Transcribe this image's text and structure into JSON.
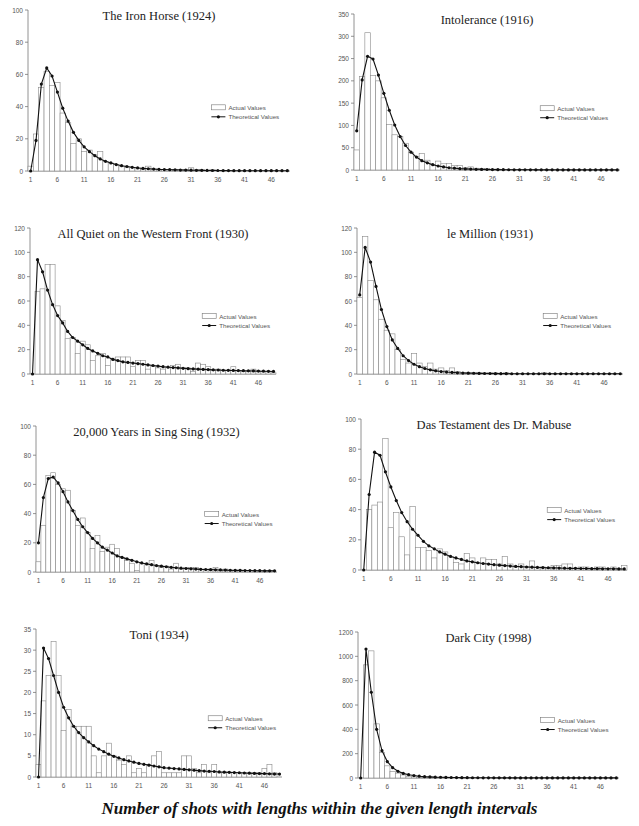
{
  "caption": "Number of shots with lengths within the given length intervals",
  "legend": {
    "actual": "Actual Values",
    "theoretical": "Theoretical Values"
  },
  "chart_data": [
    {
      "type": "bar",
      "title": "The Iron Horse (1924)",
      "xlabel": "",
      "ylabel": "",
      "ylim": [
        0,
        100
      ],
      "yticks": [
        0,
        20,
        40,
        60,
        80,
        100
      ],
      "xticks": [
        1,
        6,
        11,
        16,
        21,
        26,
        31,
        36,
        41,
        46
      ],
      "grid": false,
      "legend_position": "right-middle",
      "series": [
        {
          "name": "Actual Values",
          "kind": "bar",
          "values": [
            3,
            23,
            52,
            62,
            53,
            55,
            36,
            30,
            17,
            20,
            12,
            13,
            10,
            12,
            6,
            5,
            4,
            3,
            2,
            2,
            2,
            1,
            3,
            1,
            1,
            1,
            1,
            1,
            1,
            1,
            2,
            1,
            1,
            0,
            1,
            0,
            0,
            0,
            0,
            0,
            0,
            0,
            0,
            0,
            0,
            0,
            0,
            0,
            0
          ]
        },
        {
          "name": "Theoretical Values",
          "kind": "line",
          "values": [
            0,
            19,
            54,
            64,
            59,
            49,
            39,
            31,
            24,
            19,
            15,
            12,
            9.5,
            7.5,
            6,
            5,
            4,
            3.3,
            2.8,
            2.3,
            1.9,
            1.6,
            1.4,
            1.2,
            1,
            0.9,
            0.8,
            0.7,
            0.6,
            0.55,
            0.5,
            0.45,
            0.4,
            0.35,
            0.3,
            0.3,
            0.25,
            0.25,
            0.2,
            0.2,
            0.2,
            0.2,
            0.2,
            0.2,
            0.2,
            0.2,
            0.2,
            0.2,
            0.2
          ]
        }
      ]
    },
    {
      "type": "bar",
      "title": "Intolerance (1916)",
      "xlabel": "",
      "ylabel": "",
      "ylim": [
        0,
        350
      ],
      "yticks": [
        0,
        50,
        100,
        150,
        200,
        250,
        300,
        350
      ],
      "xticks": [
        1,
        6,
        11,
        16,
        21,
        26,
        31,
        36,
        41,
        46
      ],
      "grid": false,
      "legend_position": "right-middle",
      "series": [
        {
          "name": "Actual Values",
          "kind": "bar",
          "values": [
            45,
            210,
            308,
            212,
            200,
            162,
            102,
            79,
            75,
            60,
            40,
            30,
            37,
            22,
            12,
            20,
            14,
            15,
            10,
            10,
            5,
            7,
            4,
            3,
            3,
            2,
            2,
            1,
            1,
            1,
            1,
            1,
            1,
            1,
            0,
            1,
            0,
            0,
            0,
            0,
            0,
            0,
            0,
            0,
            0,
            0,
            0,
            0,
            0
          ]
        },
        {
          "name": "Theoretical Values",
          "kind": "line",
          "values": [
            88,
            202,
            255,
            249,
            213,
            172,
            134,
            101,
            75,
            55,
            40,
            29,
            21,
            16,
            12,
            9,
            7,
            5,
            4,
            3,
            2.5,
            2,
            1.6,
            1.3,
            1.1,
            0.9,
            0.8,
            0.7,
            0.6,
            0.5,
            0.5,
            0.4,
            0.4,
            0.3,
            0.3,
            0.3,
            0.3,
            0.2,
            0.2,
            0.2,
            0.2,
            0.2,
            0.2,
            0.2,
            0.2,
            0.2,
            0.2,
            0.2,
            0.2
          ]
        }
      ]
    },
    {
      "type": "bar",
      "title": "All Quiet on the Western Front (1930)",
      "xlabel": "",
      "ylabel": "",
      "ylim": [
        0,
        120
      ],
      "yticks": [
        0,
        20,
        40,
        60,
        80,
        100,
        120
      ],
      "xticks": [
        1,
        6,
        11,
        16,
        21,
        26,
        31,
        36,
        41,
        46
      ],
      "grid": false,
      "legend_position": "right-middle",
      "series": [
        {
          "name": "Actual Values",
          "kind": "bar",
          "values": [
            0,
            68,
            70,
            90,
            90,
            56,
            44,
            29,
            30,
            17,
            27,
            24,
            11,
            15,
            17,
            7,
            13,
            14,
            14,
            14,
            6,
            11,
            11,
            4,
            6,
            5,
            4,
            6,
            7,
            8,
            5,
            5,
            2,
            9,
            8,
            6,
            3,
            4,
            3,
            3,
            6,
            3,
            2,
            2,
            4,
            2,
            2,
            2,
            1
          ]
        },
        {
          "name": "Theoretical Values",
          "kind": "line",
          "values": [
            0,
            94,
            84,
            69,
            57,
            48,
            42,
            35,
            30,
            27,
            24,
            21,
            19,
            17,
            15,
            14,
            12,
            11,
            10,
            9.5,
            9,
            8.5,
            8,
            7.5,
            7,
            6.5,
            6,
            5.6,
            5.3,
            5,
            4.7,
            4.4,
            4.2,
            4,
            3.8,
            3.6,
            3.4,
            3.3,
            3.1,
            3,
            2.9,
            2.8,
            2.7,
            2.6,
            2.5,
            2.4,
            2.3,
            2.2,
            2.1
          ]
        }
      ]
    },
    {
      "type": "bar",
      "title": "le Million (1931)",
      "xlabel": "",
      "ylabel": "",
      "ylim": [
        0,
        120
      ],
      "yticks": [
        0,
        20,
        40,
        60,
        80,
        100,
        120
      ],
      "xticks": [
        1,
        6,
        11,
        16,
        21,
        26,
        31,
        36,
        41,
        46
      ],
      "grid": false,
      "legend_position": "right-middle",
      "series": [
        {
          "name": "Actual Values",
          "kind": "bar",
          "values": [
            63,
            113,
            77,
            61,
            45,
            36,
            33,
            20,
            12,
            9,
            17,
            9,
            6,
            9,
            4,
            5,
            3,
            5,
            2,
            1,
            1,
            1,
            1,
            1,
            1,
            1,
            0,
            1,
            0,
            0,
            0,
            0,
            0,
            0,
            1,
            0,
            0,
            0,
            0,
            0,
            0,
            0,
            0,
            0,
            0,
            0,
            0,
            0,
            0
          ]
        },
        {
          "name": "Theoretical Values",
          "kind": "line",
          "values": [
            65,
            104,
            92,
            72,
            53,
            39,
            28,
            21,
            15,
            11,
            8,
            6,
            4.5,
            3.4,
            2.6,
            2,
            1.6,
            1.3,
            1,
            0.8,
            0.7,
            0.6,
            0.5,
            0.4,
            0.4,
            0.3,
            0.3,
            0.3,
            0.2,
            0.2,
            0.2,
            0.2,
            0.2,
            0.2,
            0.2,
            0.2,
            0.2,
            0.2,
            0.2,
            0.2,
            0.2,
            0.2,
            0.2,
            0.2,
            0.2,
            0.2,
            0.2,
            0.2,
            0.2
          ]
        }
      ]
    },
    {
      "type": "bar",
      "title": "20,000 Years in Sing Sing (1932)",
      "xlabel": "",
      "ylabel": "",
      "ylim": [
        0,
        100
      ],
      "yticks": [
        0,
        20,
        40,
        60,
        80,
        100
      ],
      "xticks": [
        1,
        6,
        11,
        16,
        21,
        26,
        31,
        36,
        41,
        46
      ],
      "grid": false,
      "legend_position": "right-middle",
      "series": [
        {
          "name": "Actual Values",
          "kind": "bar",
          "values": [
            7,
            32,
            66,
            68,
            60,
            57,
            56,
            42,
            32,
            37,
            27,
            16,
            25,
            14,
            17,
            19,
            16,
            10,
            8,
            6,
            1,
            6,
            6,
            8,
            4,
            3,
            4,
            2,
            6,
            2,
            3,
            3,
            3,
            2,
            2,
            2,
            3,
            1,
            2,
            1,
            1,
            1,
            1,
            1,
            1,
            1,
            1,
            1,
            0
          ]
        },
        {
          "name": "Theoretical Values",
          "kind": "line",
          "values": [
            20,
            51,
            64,
            65,
            61,
            55,
            48,
            42,
            36,
            31,
            27,
            23,
            20,
            17,
            15,
            13,
            11,
            10,
            9,
            8,
            7,
            6.2,
            5.5,
            5,
            4.4,
            4,
            3.6,
            3.2,
            2.9,
            2.6,
            2.4,
            2.2,
            2,
            1.8,
            1.7,
            1.6,
            1.5,
            1.4,
            1.3,
            1.2,
            1.1,
            1.1,
            1,
            1,
            0.9,
            0.9,
            0.8,
            0.8,
            0.8
          ]
        }
      ]
    },
    {
      "type": "bar",
      "title": "Das Testament des Dr. Mabuse",
      "xlabel": "",
      "ylabel": "",
      "ylim": [
        0,
        100
      ],
      "yticks": [
        0,
        20,
        40,
        60,
        80,
        100
      ],
      "xticks": [
        1,
        6,
        11,
        16,
        21,
        26,
        31,
        36,
        41,
        46
      ],
      "grid": false,
      "legend_position": "right-middle",
      "series": [
        {
          "name": "Actual Values",
          "kind": "bar",
          "values": [
            0,
            40,
            43,
            45,
            87,
            28,
            38,
            22,
            10,
            42,
            15,
            15,
            13,
            8,
            14,
            12,
            9,
            5,
            4,
            11,
            8,
            5,
            8,
            7,
            7,
            4,
            9,
            4,
            2,
            4,
            2,
            6,
            2,
            2,
            1,
            3,
            3,
            4,
            4,
            1,
            2,
            2,
            1,
            2,
            2,
            1,
            2,
            1,
            3
          ]
        },
        {
          "name": "Theoretical Values",
          "kind": "line",
          "values": [
            0,
            50,
            78,
            76,
            65,
            55,
            46,
            38,
            32,
            27,
            23,
            19,
            16,
            14,
            12,
            10.5,
            9,
            8,
            7,
            6,
            5.4,
            4.8,
            4.3,
            3.9,
            3.5,
            3.2,
            2.9,
            2.6,
            2.4,
            2.2,
            2,
            1.9,
            1.7,
            1.6,
            1.5,
            1.4,
            1.3,
            1.2,
            1.1,
            1.1,
            1,
            1,
            0.9,
            0.9,
            0.8,
            0.8,
            0.8,
            0.7,
            0.7
          ]
        }
      ]
    },
    {
      "type": "bar",
      "title": "Toni (1934)",
      "xlabel": "",
      "ylabel": "",
      "ylim": [
        0,
        35
      ],
      "yticks": [
        0,
        5,
        10,
        15,
        20,
        25,
        30,
        35
      ],
      "xticks": [
        1,
        6,
        11,
        16,
        21,
        26,
        31,
        36,
        41,
        46
      ],
      "grid": false,
      "legend_position": "right-middle",
      "series": [
        {
          "name": "Actual Values",
          "kind": "bar",
          "values": [
            3,
            18,
            24,
            32,
            24,
            11,
            16,
            12,
            12,
            12,
            12,
            5,
            1,
            5,
            8,
            5,
            4,
            3,
            5,
            1,
            2,
            1,
            3,
            5,
            6,
            1,
            1,
            1,
            1,
            5,
            5,
            2,
            1,
            3,
            1,
            3,
            1,
            1,
            1,
            1,
            1,
            1,
            1,
            1,
            1,
            2,
            3,
            1,
            0
          ]
        },
        {
          "name": "Theoretical Values",
          "kind": "line",
          "values": [
            0,
            30.5,
            28,
            24,
            20,
            16.5,
            14,
            12,
            10.5,
            9.3,
            8.3,
            7.4,
            6.6,
            6,
            5.4,
            4.9,
            4.5,
            4.1,
            3.8,
            3.5,
            3.2,
            3,
            2.8,
            2.6,
            2.4,
            2.2,
            2.1,
            2,
            1.9,
            1.8,
            1.7,
            1.6,
            1.5,
            1.4,
            1.35,
            1.3,
            1.2,
            1.15,
            1.1,
            1.05,
            1,
            0.95,
            0.9,
            0.85,
            0.8,
            0.8,
            0.75,
            0.7,
            0.7
          ]
        }
      ]
    },
    {
      "type": "bar",
      "title": "Dark City (1998)",
      "xlabel": "",
      "ylabel": "",
      "ylim": [
        0,
        1200
      ],
      "yticks": [
        0,
        200,
        400,
        600,
        800,
        1000,
        1200
      ],
      "xticks": [
        1,
        6,
        11,
        16,
        21,
        26,
        31,
        36,
        41,
        46
      ],
      "grid": false,
      "legend_position": "right-middle",
      "series": [
        {
          "name": "Actual Values",
          "kind": "bar",
          "values": [
            0,
            930,
            1045,
            445,
            210,
            100,
            55,
            40,
            25,
            15,
            10,
            8,
            5,
            4,
            3,
            2,
            2,
            1,
            1,
            1,
            1,
            1,
            0,
            0,
            0,
            0,
            0,
            0,
            0,
            0,
            0,
            0,
            0,
            0,
            0,
            0,
            0,
            0,
            0,
            0,
            0,
            0,
            0,
            0,
            0,
            0,
            0,
            0,
            0
          ]
        },
        {
          "name": "Theoretical Values",
          "kind": "line",
          "values": [
            0,
            1060,
            705,
            400,
            225,
            135,
            85,
            55,
            38,
            27,
            20,
            15,
            11,
            9,
            7,
            6,
            5,
            4,
            3.5,
            3,
            2.5,
            2.2,
            2,
            1.8,
            1.6,
            1.4,
            1.3,
            1.2,
            1.1,
            1,
            1,
            1,
            1,
            1,
            1,
            1,
            1,
            1,
            1,
            1,
            1,
            1,
            1,
            1,
            1,
            1,
            1,
            1,
            1
          ]
        }
      ]
    }
  ]
}
